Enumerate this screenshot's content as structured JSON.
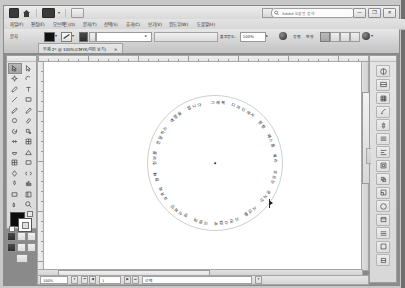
{
  "app": {
    "name": "Adobe Illustrator",
    "window_buttons": [
      "—",
      "❐",
      "✕"
    ]
  },
  "appbar": {
    "bridge_label": "Br",
    "home_label": "Home",
    "arrange_label": "문서 정돈",
    "caret": "▾",
    "search_placeholder": "Adobe 도움말 검색",
    "workspace_label": "기본 기능"
  },
  "menubar": {
    "items": [
      {
        "label": "파일(F)"
      },
      {
        "label": "편집(E)"
      },
      {
        "label": "오브젝트(O)"
      },
      {
        "label": "문자(T)"
      },
      {
        "label": "선택(S)"
      },
      {
        "label": "효과(C)"
      },
      {
        "label": "보기(V)"
      },
      {
        "label": "윈도우(W)"
      },
      {
        "label": "도움말(H)"
      }
    ]
  },
  "controlbar": {
    "selection_label": "문자",
    "fill_caret": "▾",
    "stroke_caret": "▾",
    "stroke_weight": "",
    "stroke_weight_caret": "▸",
    "style_value": "",
    "opacity_label": "불투명도:",
    "opacity_value": "100%",
    "opacity_caret": "▸",
    "align_label": "정렬",
    "transform_label": "변형",
    "distribute_label": "문서",
    "settings_label": "설정",
    "caret": "▾"
  },
  "document_tab": {
    "title": "무제-2* @ 100%(CMYK/미리 보기)",
    "close": "✕"
  },
  "toolbox": {
    "tools": [
      {
        "name": "selection-tool",
        "selected": true
      },
      {
        "name": "direct-selection-tool",
        "selected": false
      },
      {
        "name": "magic-wand-tool",
        "selected": false
      },
      {
        "name": "lasso-tool",
        "selected": false
      },
      {
        "name": "pen-tool",
        "selected": false
      },
      {
        "name": "type-tool",
        "selected": false
      },
      {
        "name": "line-segment-tool",
        "selected": false
      },
      {
        "name": "rectangle-tool",
        "selected": false
      },
      {
        "name": "paintbrush-tool",
        "selected": false
      },
      {
        "name": "pencil-tool",
        "selected": false
      },
      {
        "name": "blob-brush-tool",
        "selected": false
      },
      {
        "name": "eraser-tool",
        "selected": false
      },
      {
        "name": "rotate-tool",
        "selected": false
      },
      {
        "name": "scale-tool",
        "selected": false
      },
      {
        "name": "width-tool",
        "selected": false
      },
      {
        "name": "free-transform-tool",
        "selected": false
      },
      {
        "name": "shape-builder-tool",
        "selected": false
      },
      {
        "name": "perspective-grid-tool",
        "selected": false
      },
      {
        "name": "mesh-tool",
        "selected": false
      },
      {
        "name": "gradient-tool",
        "selected": false
      },
      {
        "name": "eyedropper-tool",
        "selected": false
      },
      {
        "name": "blend-tool",
        "selected": false
      },
      {
        "name": "symbol-sprayer-tool",
        "selected": false
      },
      {
        "name": "column-graph-tool",
        "selected": false
      },
      {
        "name": "artboard-tool",
        "selected": false
      },
      {
        "name": "slice-tool",
        "selected": false
      },
      {
        "name": "hand-tool",
        "selected": false
      },
      {
        "name": "zoom-tool",
        "selected": false
      }
    ],
    "fill_color": "#0c0c0c",
    "stroke_color": "#ffffff",
    "screen_modes": [
      "normal",
      "full-menu",
      "full"
    ]
  },
  "canvas": {
    "zoom": "100%",
    "color_mode": "CMYK",
    "artwork": {
      "type": "type-on-a-path",
      "shape": "circle",
      "text": "그래픽 디자인에서 원형 패스를 따라 흐르는 문자는 시선을 자연스럽게 이끌며 장식적인 효과와 함께 정보를 전달하는 역할을 합니다",
      "font_color": "#1c1c1c"
    }
  },
  "statusbar": {
    "zoom_value": "100%",
    "zoom_caret": "▾",
    "artboard_value": "1",
    "artboard_caret": "▾",
    "tool_value": "선택",
    "tool_caret": "▾"
  },
  "dock": {
    "panels": [
      {
        "name": "color-panel"
      },
      {
        "name": "color-guide-panel"
      },
      {
        "name": "swatches-panel"
      },
      {
        "name": "brushes-panel"
      },
      {
        "name": "symbols-panel"
      },
      {
        "name": "stroke-panel"
      },
      {
        "name": "align-panel"
      },
      {
        "name": "transform-panel"
      },
      {
        "name": "pathfinder-panel"
      },
      {
        "name": "transparency-panel"
      },
      {
        "name": "appearance-panel"
      },
      {
        "name": "graphic-styles-panel"
      },
      {
        "name": "layers-panel"
      },
      {
        "name": "artboards-panel"
      },
      {
        "name": "links-panel"
      }
    ]
  }
}
